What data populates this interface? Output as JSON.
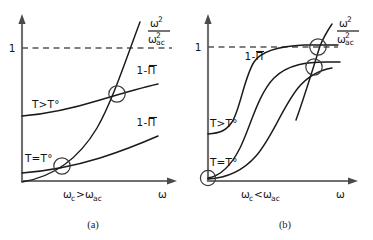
{
  "figure": {
    "background": "#ffffff",
    "ink_color": "#1a1a1a",
    "axis_color": "#6f6f6f",
    "dash_color": "#555555"
  },
  "panels": [
    {
      "id": "a",
      "caption": "(a)",
      "condition_label": "ω_c > ω_ac",
      "condition_parts": {
        "omega": "ω",
        "sub_c": "c",
        "relation": ">",
        "sub_ac": "ac"
      },
      "x_axis_label": "ω",
      "y_tick_label": "1",
      "dashed_level": 1,
      "parabola_label": {
        "numerator": "ω",
        "numerator_exp": "2",
        "denominator": "ω",
        "denominator_sub": "ac",
        "denominator_exp": "2"
      },
      "curves": [
        {
          "name": "quadratic",
          "label": "ω²/ω²ac",
          "kind": "parabola"
        },
        {
          "name": "upper-susceptibility",
          "label": "1-Π",
          "overbar": true,
          "temp_label": "T>T°",
          "kind": "concave-rising"
        },
        {
          "name": "lower-susceptibility",
          "label": "1-Π",
          "overbar": true,
          "temp_label": "T=T°",
          "kind": "concave-rising"
        }
      ],
      "intersections": [
        {
          "name": "upper-crossing",
          "x": 117,
          "y": 94
        },
        {
          "name": "lower-crossing",
          "x": 62,
          "y": 166
        }
      ]
    },
    {
      "id": "b",
      "caption": "(b)",
      "condition_label": "ω_c < ω_ac",
      "condition_parts": {
        "omega": "ω",
        "sub_c": "c",
        "relation": "<",
        "sub_ac": "ac"
      },
      "x_axis_label": "ω",
      "y_tick_label": "1",
      "dashed_level": 1,
      "parabola_label": {
        "numerator": "ω",
        "numerator_exp": "2",
        "denominator": "ω",
        "denominator_sub": "ac",
        "denominator_exp": "2"
      },
      "curves": [
        {
          "name": "quadratic",
          "label": "ω²/ω²ac",
          "kind": "steep-line"
        },
        {
          "name": "upper-sigmoid",
          "label": "1-Π",
          "overbar": true,
          "temp_label": "T>T°",
          "kind": "sigmoid"
        },
        {
          "name": "middle-sigmoid",
          "label": "",
          "overbar": false,
          "temp_label": "",
          "kind": "sigmoid"
        },
        {
          "name": "lower-sigmoid",
          "label": "",
          "overbar": false,
          "temp_label": "T=T°",
          "kind": "sigmoid"
        }
      ],
      "intersections": [
        {
          "name": "upper-crossing",
          "x": 132,
          "y": 47
        },
        {
          "name": "lower-crossing",
          "x": 128,
          "y": 67
        },
        {
          "name": "origin-marker",
          "x": 22,
          "y": 178
        }
      ]
    }
  ],
  "labels": {
    "minus": "-",
    "pi": "Π",
    "one": "1",
    "omega": "ω",
    "T": "T",
    "gt": ">",
    "eq": "=",
    "lt": "<",
    "deg": "°",
    "exp2": "2",
    "sub_ac": "ac",
    "sub_c": "c"
  }
}
